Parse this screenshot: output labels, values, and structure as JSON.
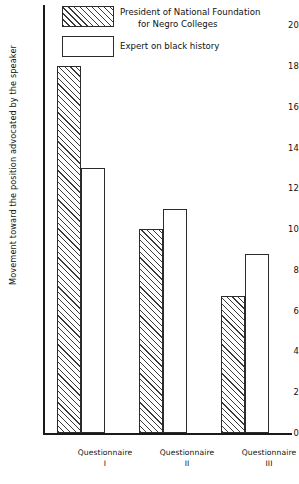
{
  "chart_data": {
    "type": "bar",
    "title": "",
    "subtitle": "",
    "xlabel": "",
    "ylabel": "Movement toward the position advocated by the speaker",
    "categories": [
      "Questionnaire I",
      "Questionnaire II",
      "Questionnaire III"
    ],
    "category_lines": [
      {
        "name": "Questionnaire",
        "roman": "I"
      },
      {
        "name": "Questionnaire",
        "roman": "II"
      },
      {
        "name": "Questionnaire",
        "roman": "III"
      }
    ],
    "series": [
      {
        "name": "President of National Foundation for Negro Colleges",
        "name_line1": "President of National Foundation",
        "name_line2": "for Negro Colleges",
        "fill": "diagonal-hatch",
        "values": [
          18,
          10,
          6.7
        ]
      },
      {
        "name": "Expert on black history",
        "name_line1": "Expert on black history",
        "name_line2": "",
        "fill": "white-outline",
        "values": [
          13,
          11,
          8.8
        ]
      }
    ],
    "ylim": [
      0,
      21
    ],
    "ytick_values": [
      0,
      2,
      4,
      6,
      8,
      10,
      12,
      14,
      16,
      18,
      20
    ],
    "ytick_labels": [
      "0",
      "2",
      "4",
      "6",
      "8",
      "10",
      "12",
      "14",
      "16",
      "18",
      "20"
    ],
    "grid": false,
    "legend_position": "top-left-inside",
    "colors": {
      "axis": "#1a1a1a",
      "bar_outline": "#2b2b2b",
      "hatch": "#3a3a3a",
      "background": "#ffffff",
      "text": "#111111"
    }
  }
}
